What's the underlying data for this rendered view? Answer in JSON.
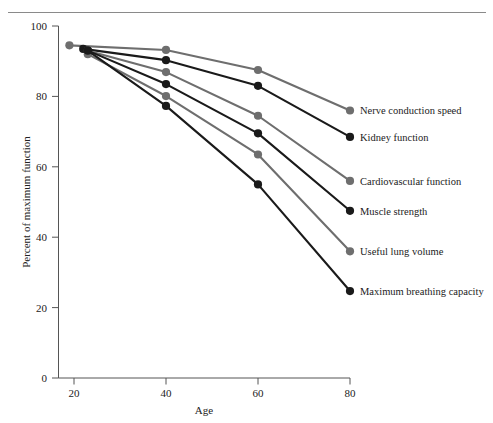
{
  "figure": {
    "name": "age-related-decline-line-chart"
  },
  "chart_data": {
    "type": "line",
    "title": "",
    "xlabel": "Age",
    "ylabel": "Percent of maximum function",
    "xlim": [
      0,
      85
    ],
    "ylim": [
      0,
      100
    ],
    "xticks": [
      20,
      40,
      60,
      80
    ],
    "yticks": [
      0,
      20,
      40,
      60,
      80,
      100
    ],
    "grid": false,
    "legend_position": "right-inline-at-line-end",
    "x_axis_tick_labels": [
      "20",
      "40",
      "60",
      "80"
    ],
    "y_axis_tick_labels": [
      "0",
      "20",
      "40",
      "60",
      "80",
      "100"
    ],
    "series": [
      {
        "name": "Nerve conduction speed",
        "color": "#6e6e6e",
        "x": [
          19,
          40,
          60,
          80
        ],
        "values": [
          94.5,
          93.2,
          87.5,
          76.0
        ]
      },
      {
        "name": "Kidney function",
        "color": "#1a1a1a",
        "x": [
          22,
          40,
          60,
          80
        ],
        "values": [
          93.5,
          90.3,
          83.0,
          68.5
        ]
      },
      {
        "name": "Cardiovascular function",
        "color": "#6e6e6e",
        "x": [
          23,
          40,
          60,
          80
        ],
        "values": [
          93.0,
          86.9,
          74.5,
          56.0
        ]
      },
      {
        "name": "Muscle strength",
        "color": "#1a1a1a",
        "x": [
          23,
          40,
          60,
          80
        ],
        "values": [
          93.0,
          83.5,
          69.5,
          47.5
        ]
      },
      {
        "name": "Useful lung volume",
        "color": "#6e6e6e",
        "x": [
          23,
          40,
          60,
          80
        ],
        "values": [
          92.0,
          80.1,
          63.5,
          36.0
        ]
      },
      {
        "name": "Maximum breathing capacity",
        "color": "#1a1a1a",
        "x": [
          23,
          40,
          60,
          80
        ],
        "values": [
          93.0,
          77.3,
          55.0,
          24.7
        ]
      }
    ]
  },
  "legend": {
    "items": [
      {
        "label": "Nerve conduction speed"
      },
      {
        "label": "Kidney function"
      },
      {
        "label": "Cardiovascular function"
      },
      {
        "label": "Muscle strength"
      },
      {
        "label": "Useful lung volume"
      },
      {
        "label": "Maximum breathing capacity"
      }
    ]
  },
  "colors": {
    "grey_series": "#6e6e6e",
    "black_series": "#1a1a1a",
    "axis": "#555555",
    "rule": "#8a8a8a",
    "background": "#ffffff"
  }
}
